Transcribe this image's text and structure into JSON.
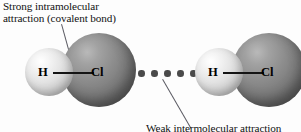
{
  "figure": {
    "background_color": "#fdfdfd"
  },
  "annotations": {
    "top": {
      "line1": "Strong intramolecular",
      "line2": "attraction (covalent bond)"
    },
    "bottom": {
      "line1": "Weak intermolecular attraction"
    }
  },
  "molecules": [
    {
      "name": "hydrogen-chloride-left",
      "atoms": [
        {
          "symbol": "H",
          "element": "hydrogen",
          "color": "#e3e3e3"
        },
        {
          "symbol": "Cl",
          "element": "chlorine",
          "color": "#7a7a7a"
        }
      ]
    },
    {
      "name": "hydrogen-chloride-right",
      "atoms": [
        {
          "symbol": "H",
          "element": "hydrogen",
          "color": "#e3e3e3"
        },
        {
          "symbol": "Cl",
          "element": "chlorine",
          "color": "#7a7a7a"
        }
      ]
    }
  ],
  "intermolecular": {
    "marker": "dotted-line",
    "dot_count": 5,
    "dot_color": "#4a4a4a"
  },
  "colors": {
    "hydrogen_sphere": "#e3e3e3",
    "chlorine_sphere": "#7a7a7a",
    "bond_line": "#141414",
    "leader_line": "#5a5a62",
    "text": "#111111"
  }
}
